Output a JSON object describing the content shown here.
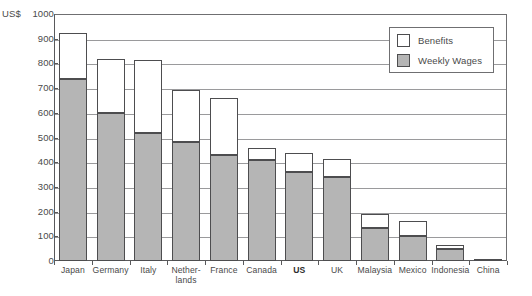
{
  "chart_data": {
    "type": "bar",
    "stacked": true,
    "title": "",
    "xlabel": "",
    "ylabel": "US$",
    "ylim": [
      0,
      1000
    ],
    "ytick_step": 100,
    "yticks": [
      "1000",
      "900",
      "800",
      "700",
      "600",
      "500",
      "400",
      "300",
      "200",
      "100",
      "0"
    ],
    "grid": true,
    "legend_position": "top-right",
    "categories": [
      "Japan",
      "Germany",
      "Italy",
      "Nether-\nlands",
      "France",
      "Canada",
      "US",
      "UK",
      "Malaysia",
      "Mexico",
      "Indonesia",
      "China"
    ],
    "series": [
      {
        "name": "Weekly Wages",
        "color": "#b5b5b5",
        "values": [
          735,
          600,
          520,
          480,
          430,
          410,
          360,
          340,
          135,
          100,
          50,
          8
        ]
      },
      {
        "name": "Benefits",
        "color": "#ffffff",
        "values": [
          185,
          215,
          290,
          210,
          225,
          45,
          75,
          70,
          50,
          60,
          10,
          0
        ]
      }
    ],
    "totals": [
      920,
      815,
      810,
      690,
      655,
      455,
      435,
      410,
      185,
      160,
      60,
      8
    ],
    "annotations": [
      "Source: US Department of Labor figures"
    ]
  },
  "axis": {
    "unit_label": "US$"
  },
  "legend": {
    "items": [
      {
        "label": "Benefits"
      },
      {
        "label": "Weekly Wages"
      }
    ]
  },
  "source": {
    "text": "Source: US Department of Labor figures"
  },
  "colors": {
    "wages_fill": "#b5b5b5",
    "benefits_fill": "#ffffff",
    "bar_outline": "#4d4d4f",
    "axis": "#59595b",
    "gridline": "#9a9a9c",
    "text": "#4a4a4a"
  }
}
